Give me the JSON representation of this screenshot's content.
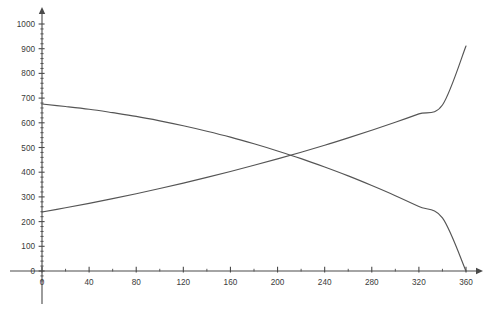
{
  "chart_data": {
    "type": "line",
    "title": "",
    "subtitle": "",
    "xlabel": "",
    "ylabel": "",
    "xlim": [
      0,
      360
    ],
    "ylim": [
      0,
      1000
    ],
    "grid": false,
    "legend": "none",
    "x_ticks": [
      0,
      40,
      80,
      120,
      160,
      200,
      240,
      280,
      320,
      360
    ],
    "x_tick_labels": [
      "0",
      "40",
      "80",
      "120",
      "160",
      "200",
      "240",
      "280",
      "320",
      "360"
    ],
    "x_minor_step": 20,
    "y_ticks": [
      0,
      100,
      200,
      300,
      400,
      500,
      600,
      700,
      800,
      900,
      1000
    ],
    "y_tick_labels": [
      "0",
      "100",
      "200",
      "300",
      "400",
      "500",
      "600",
      "700",
      "800",
      "900",
      "1000"
    ],
    "y_minor_step": 20,
    "axis_color": "#4a4a4a",
    "line_color": "#555555",
    "background_color": "#ffffff",
    "x": [
      0,
      20,
      40,
      60,
      80,
      100,
      120,
      140,
      160,
      180,
      200,
      220,
      240,
      260,
      280,
      300,
      320,
      340,
      360
    ],
    "series": [
      {
        "name": "decreasing-curve",
        "color": "#555555",
        "values": [
          676,
          666,
          655,
          641,
          626,
          608,
          588,
          566,
          542,
          515,
          486,
          455,
          421,
          385,
          346,
          305,
          261,
          215,
          0
        ]
      },
      {
        "name": "increasing-curve",
        "color": "#555555",
        "values": [
          239,
          256,
          274,
          293,
          313,
          334,
          356,
          379,
          403,
          428,
          454,
          481,
          509,
          539,
          570,
          602,
          636,
          672,
          911
        ]
      }
    ],
    "annotations": [
      {
        "name": "intersection",
        "x": 175,
        "y": 452
      }
    ]
  }
}
